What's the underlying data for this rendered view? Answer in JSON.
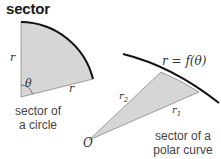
{
  "title": "sector",
  "circle_sector": {
    "radius_label_left": "r",
    "radius_label_bottom": "r",
    "angle_label": "θ",
    "caption_line1": "sector of",
    "caption_line2": "a circle"
  },
  "polar_sector": {
    "curve_label": "r = f(θ)",
    "origin_label": "O",
    "r1_label": "r",
    "r1_sub": "1",
    "r2_label": "r",
    "r2_sub": "2",
    "caption_line1": "sector of a",
    "caption_line2": "polar curve"
  },
  "colors": {
    "fill": "#d4d4d4",
    "stroke": "#111111",
    "edge": "#777777"
  }
}
